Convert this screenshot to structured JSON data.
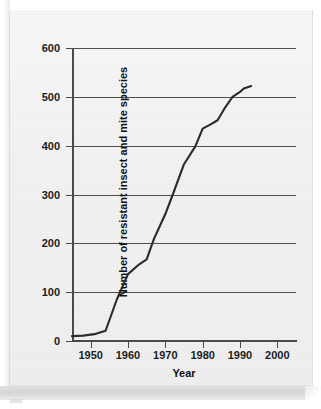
{
  "chart_data": {
    "type": "line",
    "title": "",
    "xlabel": "Year",
    "ylabel": "Number of resistant insect and mite species",
    "xlim": [
      1945,
      2005
    ],
    "ylim": [
      0,
      600
    ],
    "xticks": [
      1950,
      1960,
      1970,
      1980,
      1990,
      2000
    ],
    "yticks": [
      0,
      100,
      200,
      300,
      400,
      500,
      600
    ],
    "grid": "horizontal",
    "legend": "none",
    "line_color": "#2b2b2b",
    "series": [
      {
        "name": "Resistant insect and mite species",
        "x": [
          1945,
          1948,
          1951,
          1954,
          1957,
          1960,
          1963,
          1965,
          1967,
          1970,
          1972,
          1975,
          1978,
          1980,
          1982,
          1984,
          1986,
          1988,
          1990,
          1991,
          1993
        ],
        "values": [
          10,
          11,
          14,
          21,
          85,
          137,
          157,
          167,
          210,
          260,
          300,
          362,
          398,
          435,
          443,
          452,
          478,
          500,
          510,
          517,
          522
        ]
      }
    ]
  },
  "axis": {
    "y_tick_labels": [
      "600",
      "500",
      "400",
      "300",
      "200",
      "100",
      "0"
    ],
    "x_tick_labels": [
      "1950",
      "1960",
      "1970",
      "1980",
      "1990",
      "2000"
    ],
    "x_title": "Year",
    "y_title": "Number of resistant insect and mite species"
  }
}
